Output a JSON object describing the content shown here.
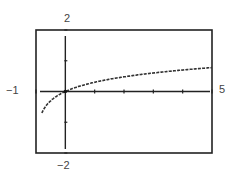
{
  "chart_data": {
    "type": "line",
    "title": "",
    "xlabel": "",
    "ylabel": "",
    "xlim": [
      -1,
      5
    ],
    "ylim": [
      -2,
      2
    ],
    "xscl": 1,
    "yscl": 1,
    "grid": false,
    "legend": null,
    "window_labels": {
      "xmin": "−1",
      "xmax": "5",
      "ymin": "−2",
      "ymax": "2"
    },
    "series": [
      {
        "name": "y = log(x+1)",
        "style": "dotted-pixel",
        "x": [
          -0.8,
          -0.6,
          -0.4,
          -0.2,
          0,
          0.5,
          1,
          1.5,
          2,
          2.5,
          3,
          3.5,
          4,
          4.5,
          5
        ],
        "y": [
          -0.7,
          -0.4,
          -0.22,
          -0.1,
          0,
          0.18,
          0.3,
          0.4,
          0.48,
          0.54,
          0.6,
          0.65,
          0.7,
          0.74,
          0.78
        ]
      }
    ]
  },
  "colors": {
    "frame": "#222222",
    "axis": "#222222",
    "curve": "#333333",
    "background": "#ffffff"
  }
}
